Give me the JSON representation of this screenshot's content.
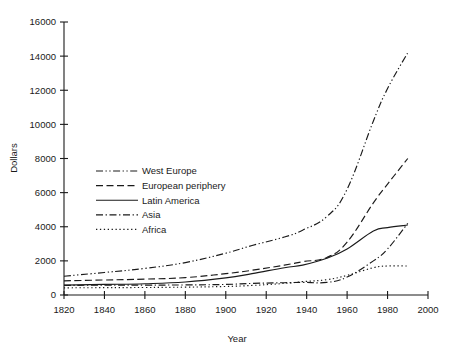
{
  "chart_data": {
    "type": "line",
    "title": "",
    "xlabel": "Year",
    "ylabel": "Dollars",
    "xlim": [
      1820,
      2000
    ],
    "ylim": [
      0,
      16000
    ],
    "xticks": [
      1820,
      1840,
      1860,
      1880,
      1900,
      1920,
      1940,
      1960,
      1980,
      2000
    ],
    "yticks": [
      0,
      2000,
      4000,
      6000,
      8000,
      10000,
      12000,
      14000,
      16000
    ],
    "grid": false,
    "legend_position": "center-left",
    "x": [
      1820,
      1840,
      1860,
      1880,
      1900,
      1913,
      1929,
      1938,
      1950,
      1960,
      1973,
      1980,
      1990
    ],
    "series": [
      {
        "name": "West Europe",
        "linestyle": "dash-dot-dot",
        "values": [
          1100,
          1320,
          1560,
          1900,
          2450,
          2900,
          3400,
          3800,
          4600,
          6200,
          10200,
          12100,
          14200
        ]
      },
      {
        "name": "European periphery",
        "linestyle": "dashed",
        "values": [
          830,
          880,
          930,
          1020,
          1250,
          1450,
          1750,
          1950,
          2200,
          3100,
          5400,
          6500,
          8000
        ]
      },
      {
        "name": "Latin America",
        "linestyle": "solid",
        "values": [
          580,
          620,
          660,
          760,
          1000,
          1250,
          1600,
          1750,
          2150,
          2700,
          3750,
          3950,
          4100
        ]
      },
      {
        "name": "Asia",
        "linestyle": "dash-dot",
        "values": [
          560,
          580,
          580,
          590,
          620,
          680,
          720,
          740,
          740,
          1050,
          2000,
          2700,
          4200
        ]
      },
      {
        "name": "Africa",
        "linestyle": "dotted",
        "values": [
          420,
          430,
          440,
          460,
          500,
          560,
          680,
          780,
          900,
          1150,
          1600,
          1700,
          1700
        ]
      }
    ]
  },
  "axes": {
    "x_axis_title": "Year",
    "y_axis_title": "Dollars",
    "x_tick_labels": [
      "1820",
      "1840",
      "1860",
      "1880",
      "1900",
      "1920",
      "1940",
      "1960",
      "1980",
      "2000"
    ],
    "y_tick_labels": [
      "0",
      "2000",
      "4000",
      "6000",
      "8000",
      "10000",
      "12000",
      "14000",
      "16000"
    ]
  },
  "legend": {
    "items": [
      {
        "label": "West Europe",
        "style": "dash-dot-dot"
      },
      {
        "label": "European periphery",
        "style": "dashed"
      },
      {
        "label": "Latin America",
        "style": "solid"
      },
      {
        "label": "Asia",
        "style": "dash-dot"
      },
      {
        "label": "Africa",
        "style": "dotted"
      }
    ]
  },
  "colors": {
    "ink": "#1a1a1a",
    "background": "#ffffff"
  }
}
